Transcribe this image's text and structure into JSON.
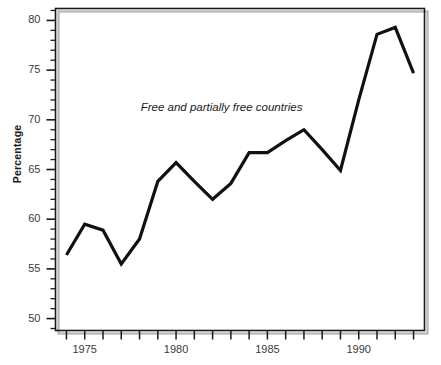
{
  "chart_data": {
    "type": "line",
    "title": "",
    "subtitle": "",
    "xlabel": "",
    "ylabel": "Percentage",
    "xlim": [
      1973.4,
      1993.6
    ],
    "ylim": [
      48.8,
      81.2
    ],
    "grid": false,
    "legend_position": "none",
    "annotations": [
      {
        "text": "Free and partially free countries",
        "x": 1982.5,
        "y": 71.2,
        "style": "italic"
      }
    ],
    "y_ticks_major": [
      50,
      55,
      60,
      65,
      70,
      75,
      80
    ],
    "y_tick_labels": [
      "50",
      "55",
      "60",
      "65",
      "70",
      "75",
      "80"
    ],
    "y_ticks_minor_step": 1,
    "x_ticks_major": [
      1975,
      1980,
      1985,
      1990
    ],
    "x_tick_labels": [
      "1975",
      "1980",
      "1985",
      "1990"
    ],
    "x_ticks_all": [
      1974,
      1975,
      1976,
      1977,
      1978,
      1979,
      1980,
      1981,
      1982,
      1983,
      1984,
      1985,
      1986,
      1987,
      1988,
      1989,
      1990,
      1991,
      1992,
      1993
    ],
    "x": [
      1974,
      1975,
      1976,
      1977,
      1978,
      1979,
      1980,
      1981,
      1982,
      1983,
      1984,
      1985,
      1986,
      1987,
      1988,
      1989,
      1990,
      1991,
      1992,
      1993
    ],
    "series": [
      {
        "name": "Free and partially free countries",
        "color": "#111111",
        "line_width": 3.2,
        "values": [
          56.4,
          59.5,
          58.9,
          55.5,
          58.0,
          63.8,
          65.7,
          63.8,
          62.0,
          63.6,
          66.7,
          66.7,
          67.9,
          69.0,
          67.0,
          64.9,
          72.0,
          78.6,
          79.3,
          74.7
        ]
      }
    ]
  },
  "figure": {
    "background_color": "#ffffff",
    "frame_color": "#1a1a1a",
    "tick_color": "#1a1a1a",
    "shadow_color": "#b9b9b9"
  }
}
